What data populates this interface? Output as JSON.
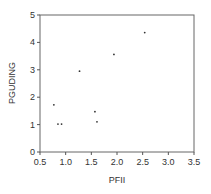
{
  "chart_data": {
    "type": "scatter",
    "title": "",
    "xlabel": "PFII",
    "ylabel": "PGUDING",
    "xlim": [
      0.5,
      3.5
    ],
    "ylim": [
      0,
      5
    ],
    "xticks": [
      "0.5",
      "1.0",
      "1.5",
      "2.0",
      "2.5",
      "3.0",
      "3.5"
    ],
    "yticks": [
      "0",
      "1",
      "2",
      "3",
      "4",
      "5"
    ],
    "grid": false,
    "legend": null,
    "series": [
      {
        "name": "PGUDING vs PFII",
        "points": [
          {
            "x": 0.77,
            "y": 1.72
          },
          {
            "x": 0.85,
            "y": 1.02
          },
          {
            "x": 0.92,
            "y": 1.02
          },
          {
            "x": 1.27,
            "y": 2.95
          },
          {
            "x": 1.57,
            "y": 1.47
          },
          {
            "x": 1.61,
            "y": 1.1
          },
          {
            "x": 1.94,
            "y": 3.56
          },
          {
            "x": 2.54,
            "y": 4.36
          }
        ]
      }
    ]
  },
  "colors": {
    "axis": "#555555",
    "point": "#333333",
    "text": "#333333"
  }
}
